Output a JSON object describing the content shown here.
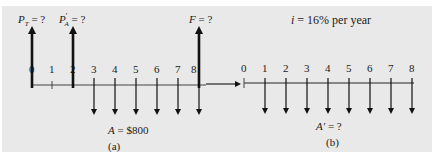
{
  "diagram": {
    "interest_label": {
      "var": "i",
      "text": " = 16% per year"
    },
    "panel_a": {
      "caption": "(a)",
      "periods": [
        "0",
        "1",
        "2",
        "3",
        "4",
        "5",
        "6",
        "7",
        "8"
      ],
      "upward_arrows": [
        {
          "period": 0,
          "label_main": "P",
          "label_sub": "T",
          "label_rest": " = ?"
        },
        {
          "period": 2,
          "label_main": "P",
          "label_prime": "′",
          "label_sub": "A",
          "label_rest": " = ?"
        },
        {
          "period": 8,
          "label_main": "F",
          "label_rest": " = ?"
        }
      ],
      "downward_arrow_periods": [
        3,
        4,
        5,
        6,
        7,
        8
      ],
      "downward_label": {
        "var": "A",
        "text": " = $800"
      }
    },
    "panel_b": {
      "caption": "(b)",
      "periods": [
        "0",
        "1",
        "2",
        "3",
        "4",
        "5",
        "6",
        "7",
        "8"
      ],
      "downward_arrow_periods": [
        1,
        2,
        3,
        4,
        5,
        6,
        7,
        8
      ],
      "downward_label": {
        "var": "A′",
        "text": " = ?"
      }
    }
  }
}
